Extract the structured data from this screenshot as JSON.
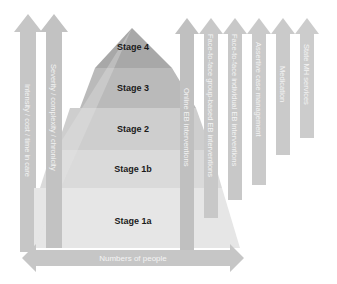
{
  "diagram": {
    "pyramid": {
      "stages": [
        {
          "label": "Stage 4",
          "color": "#a9a9a9"
        },
        {
          "label": "Stage 3",
          "color": "#bdbdbd"
        },
        {
          "label": "Stage 2",
          "color": "#cfcfcf"
        },
        {
          "label": "Stage 1b",
          "color": "#dcdcdc"
        },
        {
          "label": "Stage 1a",
          "color": "#e6e6e6"
        }
      ]
    },
    "left_arrows": [
      {
        "label": "Intensity / cost / time in care"
      },
      {
        "label": "Severity / complexity / chronicity"
      }
    ],
    "bottom_arrow": {
      "label": "Numbers of people"
    },
    "right_arrows": [
      {
        "label": "Online EB interventions"
      },
      {
        "label": "Face-to-face group-based EB interventions"
      },
      {
        "label": "Face-to-face individual EB interventions"
      },
      {
        "label": "Assertive case management"
      },
      {
        "label": "Medication"
      },
      {
        "label": "State MH services"
      }
    ],
    "colors": {
      "arrow": "#c4c4c4",
      "arrow_light": "#d2d2d2",
      "background": "#ffffff"
    }
  }
}
